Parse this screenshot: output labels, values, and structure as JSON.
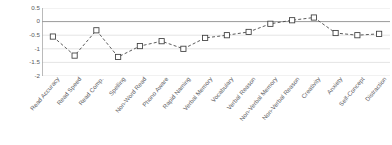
{
  "chart_data": {
    "type": "line",
    "title": "",
    "xlabel": "",
    "ylabel": "",
    "ylim": [
      -2,
      0.5
    ],
    "yticks": [
      0.5,
      0,
      -0.5,
      -1,
      -1.5,
      -2
    ],
    "ytick_labels": [
      "0.5",
      "0",
      "-0.5",
      "-1",
      "-1.5",
      "-2"
    ],
    "grid": true,
    "legend": "none",
    "zero_line": 0,
    "marker": "open-square",
    "line_style": "dashed",
    "line_color": "#4a4a4a",
    "marker_edge_color": "#3c3c3c",
    "marker_face_color": "#ffffff",
    "grid_color": "#d9d9d9",
    "zero_line_color": "#9a9a9a",
    "categories": [
      "Read Accuracy",
      "Read Speed",
      "Read Comp.",
      "Spelling",
      "Non-Word Read",
      "Phono Aware",
      "Rapid Naming",
      "Verbal Memory",
      "Vocabulary",
      "Verbal Reason",
      "Non-Verbal Memory",
      "Non-Verbal Reason",
      "Creativity",
      "Anxiety",
      "Self-Concept",
      "Distraction"
    ],
    "values": [
      -0.55,
      -1.25,
      -0.32,
      -1.3,
      -0.9,
      -0.72,
      -1.0,
      -0.6,
      -0.5,
      -0.38,
      -0.08,
      0.05,
      0.15,
      -0.42,
      -0.5,
      -0.45
    ]
  }
}
